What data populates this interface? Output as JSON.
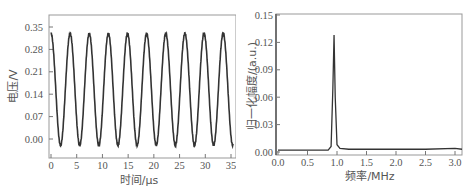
{
  "chart_data": [
    {
      "type": "line",
      "panel": "left",
      "title": "",
      "xlabel": "时间/μs",
      "ylabel": "电压/V",
      "xlim": [
        0,
        35
      ],
      "ylim": [
        -0.04,
        0.38
      ],
      "xticks": [
        0,
        5,
        10,
        15,
        20,
        25,
        30,
        35
      ],
      "xtick_labels": [
        "0",
        "5",
        "10",
        "15",
        "20",
        "25",
        "30",
        "35"
      ],
      "yticks": [
        0.0,
        0.07,
        0.14,
        0.21,
        0.28,
        0.35
      ],
      "ytick_labels": [
        "0.00",
        "0.07",
        "0.14",
        "0.21",
        "0.28",
        "0.35"
      ],
      "grid": false,
      "legend": null,
      "series": [
        {
          "name": "voltage waveform",
          "description": "sinusoid, ~9.5 cycles over 35 μs",
          "period_us": 3.72,
          "peak_v": 0.33,
          "trough_v": -0.02,
          "phase_start": "peak at t=0",
          "color": "#333333"
        }
      ]
    },
    {
      "type": "line",
      "panel": "right",
      "title": "",
      "xlabel": "频率/MHz",
      "ylabel": "归一化幅度/(a.u.)",
      "xlim": [
        0.0,
        3.15
      ],
      "ylim": [
        -0.002,
        0.152
      ],
      "xticks": [
        0.0,
        0.5,
        1.0,
        1.5,
        2.0,
        2.5,
        3.0
      ],
      "xtick_labels": [
        "0.0",
        "0.5",
        "1.0",
        "1.5",
        "2.0",
        "2.5",
        "3.0"
      ],
      "yticks": [
        0.0,
        0.03,
        0.06,
        0.09,
        0.12,
        0.15
      ],
      "ytick_labels": [
        "0.00",
        "0.03",
        "0.06",
        "0.09",
        "0.12",
        "0.15"
      ],
      "grid": false,
      "legend": null,
      "series": [
        {
          "name": "normalized spectrum",
          "x": [
            0.0,
            0.3,
            0.6,
            0.85,
            0.9,
            0.93,
            0.95,
            0.97,
            1.0,
            1.05,
            1.2,
            1.5,
            2.0,
            2.5,
            3.0,
            3.15
          ],
          "y": [
            0.002,
            0.002,
            0.002,
            0.002,
            0.006,
            0.07,
            0.128,
            0.06,
            0.008,
            0.004,
            0.003,
            0.003,
            0.003,
            0.003,
            0.004,
            0.003
          ],
          "peak": {
            "x": 0.95,
            "y": 0.128
          },
          "color": "#333333"
        }
      ]
    }
  ],
  "left": {
    "xlabel": "时间/μs",
    "ylabel": "电压/V",
    "xtick_labels": [
      "0",
      "5",
      "10",
      "15",
      "20",
      "25",
      "30",
      "35"
    ],
    "ytick_labels": [
      "0.00",
      "0.07",
      "0.14",
      "0.21",
      "0.28",
      "0.35"
    ]
  },
  "right": {
    "xlabel": "频率/MHz",
    "ylabel": "归一化幅度/(a.u.)",
    "xtick_labels": [
      "0.0",
      "0.5",
      "1.0",
      "1.5",
      "2.0",
      "2.5",
      "3.0"
    ],
    "ytick_labels": [
      "0.00",
      "0.03",
      "0.06",
      "0.09",
      "0.12",
      "0.15"
    ]
  },
  "colors": {
    "line": "#333333",
    "frame": "#888888",
    "text": "#555555"
  }
}
